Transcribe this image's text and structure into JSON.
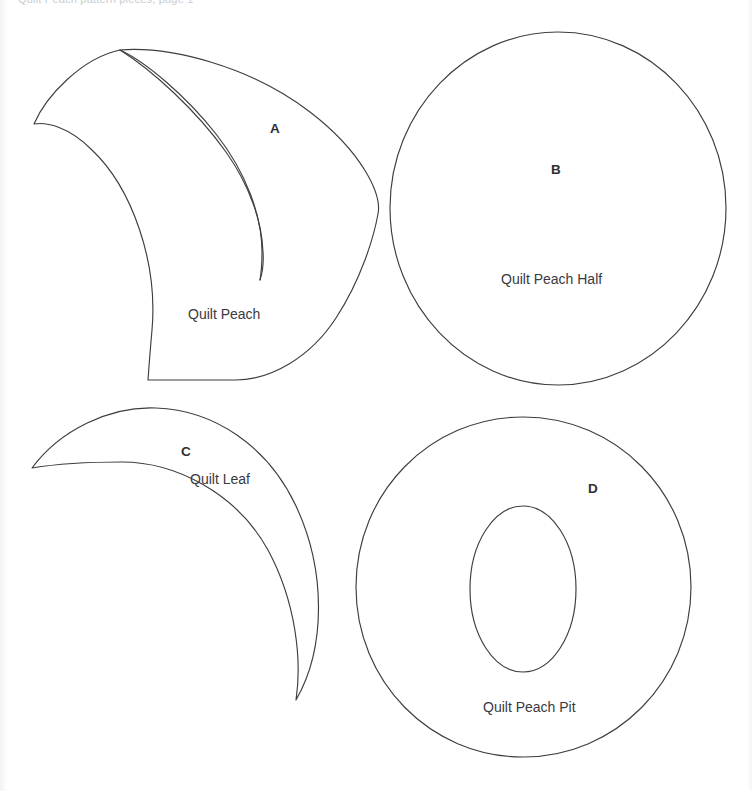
{
  "page": {
    "background_color": "#ffffff",
    "stroke_color": "#3d3d42",
    "text_color": "#3a3a3e",
    "header_faint_text": "Quilt Peach pattern pieces, page 1"
  },
  "pieces": [
    {
      "id": "A",
      "letter": "A",
      "name": "Quilt Peach",
      "shape": "peach-with-crease",
      "letter_pos": {
        "x": 270,
        "y": 121
      },
      "name_pos": {
        "x": 188,
        "y": 306
      }
    },
    {
      "id": "B",
      "letter": "B",
      "name": "Quilt Peach Half",
      "shape": "circle",
      "letter_pos": {
        "x": 551,
        "y": 162
      },
      "name_pos": {
        "x": 501,
        "y": 271
      }
    },
    {
      "id": "C",
      "letter": "C",
      "name": "Quilt Leaf",
      "shape": "leaf-crescent",
      "letter_pos": {
        "x": 181,
        "y": 444
      },
      "name_pos": {
        "x": 190,
        "y": 471
      }
    },
    {
      "id": "D",
      "letter": "D",
      "name": "Quilt Peach Pit",
      "shape": "annulus-circle-with-oval",
      "letter_pos": {
        "x": 588,
        "y": 481
      },
      "name_pos": {
        "x": 483,
        "y": 699
      }
    }
  ]
}
